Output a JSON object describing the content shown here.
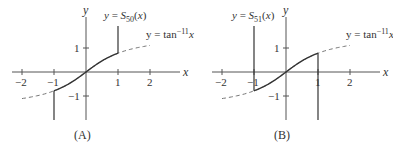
{
  "chart_data": [
    {
      "type": "line",
      "panel_label": "(A)",
      "title": "",
      "xlabel": "x",
      "ylabel": "y",
      "x_ticks": [
        "-2",
        "-1",
        "1",
        "2"
      ],
      "y_ticks": [
        "1",
        "-1"
      ],
      "xlim": [
        -2.3,
        2.9
      ],
      "ylim": [
        -2,
        2.3
      ],
      "grid": false,
      "series": [
        {
          "name": "y = S50(x)",
          "label_main": "y = S",
          "label_sub": "50",
          "label_tail": "(x)",
          "style": "solid",
          "domain": [
            -1,
            1
          ],
          "note": "tracks tan^-1 x on [-1,1], vertical spikes up at x=1 and down at x=-1"
        },
        {
          "name": "y = tan^-1 x",
          "label_main": "y = tan",
          "label_sup": "−1",
          "label_tail": "x",
          "style": "dashed",
          "domain": [
            -2,
            2
          ]
        }
      ]
    },
    {
      "type": "line",
      "panel_label": "(B)",
      "title": "",
      "xlabel": "x",
      "ylabel": "y",
      "x_ticks": [
        "-2",
        "-1",
        "1",
        "2"
      ],
      "y_ticks": [
        "1",
        "-1"
      ],
      "xlim": [
        -2.3,
        2.9
      ],
      "ylim": [
        -2,
        2.3
      ],
      "grid": false,
      "series": [
        {
          "name": "y = S51(x)",
          "label_main": "y = S",
          "label_sub": "51",
          "label_tail": "(x)",
          "style": "solid",
          "domain": [
            -1,
            1
          ],
          "note": "tracks tan^-1 x on [-1,1], vertical spikes down at x=1 and up at x=-1"
        },
        {
          "name": "y = tan^-1 x",
          "label_main": "y = tan",
          "label_sup": "−1",
          "label_tail": "x",
          "style": "dashed",
          "domain": [
            -2,
            2
          ]
        }
      ]
    }
  ]
}
